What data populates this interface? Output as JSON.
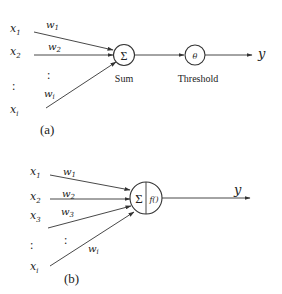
{
  "diagram_a": {
    "caption": "(a)",
    "inputs": [
      "x1",
      "x2",
      "xi"
    ],
    "input_labels": [
      {
        "main": "x",
        "sub": "1"
      },
      {
        "main": "x",
        "sub": "2"
      },
      {
        "main": "x",
        "sub": "i"
      }
    ],
    "weights": [
      {
        "main": "w",
        "sub": "1"
      },
      {
        "main": "w",
        "sub": "2"
      },
      {
        "main": "w",
        "sub": "i"
      }
    ],
    "ellipsis": ":",
    "sum_node": {
      "symbol": "Σ",
      "label": "Sum"
    },
    "threshold_node": {
      "symbol": "θ",
      "label": "Threshold"
    },
    "output": "y"
  },
  "diagram_b": {
    "caption": "(b)",
    "input_labels": [
      {
        "main": "x",
        "sub": "1"
      },
      {
        "main": "x",
        "sub": "2"
      },
      {
        "main": "x",
        "sub": "3"
      },
      {
        "main": "x",
        "sub": "i"
      }
    ],
    "weights": [
      {
        "main": "w",
        "sub": "1"
      },
      {
        "main": "w",
        "sub": "2"
      },
      {
        "main": "w",
        "sub": "3"
      },
      {
        "main": "w",
        "sub": "i"
      }
    ],
    "ellipsis": ":",
    "node": {
      "sum_symbol": "Σ",
      "activation": "f()"
    },
    "output": "y"
  }
}
